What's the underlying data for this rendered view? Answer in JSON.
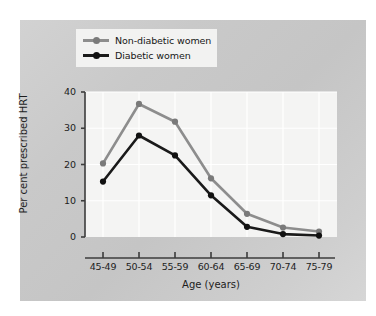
{
  "chart_data": {
    "type": "line",
    "title": "",
    "xlabel": "Age (years)",
    "ylabel": "Per cent prescribed HRT",
    "categories": [
      "45-49",
      "50-54",
      "55-59",
      "60-64",
      "65-69",
      "70-74",
      "75-79"
    ],
    "ylim": [
      0,
      40
    ],
    "yticks": [
      0,
      10,
      20,
      30,
      40
    ],
    "ytick_labels": [
      "0",
      "10",
      "20",
      "30",
      "40"
    ],
    "grid": true,
    "legend_position": "top-left-outside",
    "series": [
      {
        "name": "Non-diabetic women",
        "color": "#8d8d8d",
        "marker_color": "#7a7a7a",
        "values": [
          20.3,
          36.7,
          31.8,
          16.2,
          6.4,
          2.6,
          1.5
        ]
      },
      {
        "name": "Diabetic women",
        "color": "#1a1a1a",
        "marker_color": "#111111",
        "values": [
          15.3,
          28.0,
          22.5,
          11.5,
          2.8,
          0.8,
          0.4
        ]
      }
    ]
  },
  "legend": {
    "items": [
      {
        "label": "Non-diabetic women"
      },
      {
        "label": "Diabetic women"
      }
    ]
  },
  "colors": {
    "panel_background": "#c9c9c9",
    "plot_background": "#f4f4f3",
    "axis": "#3c3c3c",
    "gridline": "#ffffff",
    "non_diabetic": "#8d8d8d",
    "diabetic": "#1a1a1a",
    "text": "#1d1d1d"
  }
}
